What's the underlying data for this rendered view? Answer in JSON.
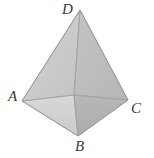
{
  "figure": {
    "kind": "3d-pyramid-diagram",
    "background_color": "#ffffff",
    "label_color": "#3a3a3a",
    "edge_color": "#9a9a9a",
    "outline_color": "#8a8a8a",
    "faces": [
      {
        "name": "face-upper-left",
        "fill": "#c9c9c9"
      },
      {
        "name": "face-upper-right",
        "fill": "#bdbdbd"
      },
      {
        "name": "face-lower-left",
        "fill": "#d2d2d2"
      },
      {
        "name": "face-lower-right",
        "fill": "#b2b2b2"
      }
    ],
    "vertices": {
      "apex": {
        "label": "D",
        "x": 80,
        "y": 10
      },
      "left": {
        "label": "A",
        "x": 22,
        "y": 101
      },
      "right": {
        "label": "C",
        "x": 128,
        "y": 100
      },
      "bottom": {
        "label": "B",
        "x": 78,
        "y": 136
      },
      "back": {
        "label": "",
        "x": 74,
        "y": 95
      }
    }
  }
}
